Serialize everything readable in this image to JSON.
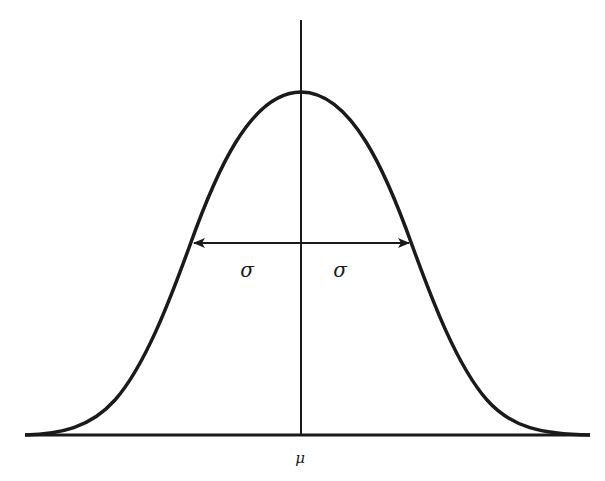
{
  "diagram": {
    "type": "normal-distribution-curve",
    "labels": {
      "sigma_left": "σ",
      "sigma_right": "σ",
      "mean": "μ"
    },
    "colors": {
      "stroke": "#1a1a1a",
      "background": "#ffffff"
    }
  }
}
